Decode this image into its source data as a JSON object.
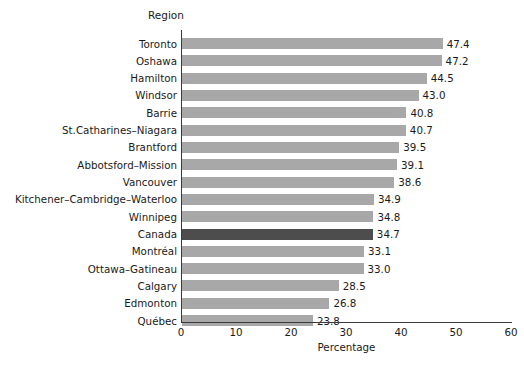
{
  "chart_data": {
    "type": "bar",
    "orientation": "horizontal",
    "title": "",
    "xlabel": "Percentage",
    "ylabel": "Region",
    "xlim": [
      0,
      60
    ],
    "xticks": [
      0,
      10,
      20,
      30,
      40,
      50,
      60
    ],
    "grid": false,
    "legend": null,
    "categories": [
      "Toronto",
      "Oshawa",
      "Hamilton",
      "Windsor",
      "Barrie",
      "St.Catharines–Niagara",
      "Brantford",
      "Abbotsford–Mission",
      "Vancouver",
      "Kitchener–Cambridge–Waterloo",
      "Winnipeg",
      "Canada",
      "Montréal",
      "Ottawa–Gatineau",
      "Calgary",
      "Edmonton",
      "Québec"
    ],
    "values": [
      47.4,
      47.2,
      44.5,
      43.0,
      40.8,
      40.7,
      39.5,
      39.1,
      38.6,
      34.9,
      34.8,
      34.7,
      33.1,
      33.0,
      28.5,
      26.8,
      23.8
    ],
    "value_labels": [
      "47.4",
      "47.2",
      "44.5",
      "43.0",
      "40.8",
      "40.7",
      "39.5",
      "39.1",
      "38.6",
      "34.9",
      "34.8",
      "34.7",
      "33.1",
      "33.0",
      "28.5",
      "26.8",
      "23.8"
    ],
    "highlight_category": "Canada",
    "colors": {
      "bar": "#a8a8a8",
      "bar_highlight": "#4d4d4d",
      "axis": "#3a3a3a",
      "text": "#1a1a1a"
    }
  },
  "axis": {
    "y_header": "Region",
    "x_title": "Percentage",
    "x_tick_labels": [
      "0",
      "10",
      "20",
      "30",
      "40",
      "50",
      "60"
    ]
  },
  "footer": {
    "fragment": ""
  }
}
